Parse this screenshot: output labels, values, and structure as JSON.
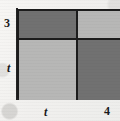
{
  "figure": {
    "type": "area-model-rectangle-partition",
    "background_color": "#f4f3f1",
    "line_color": "#1c1c1c"
  },
  "chart_data": {
    "type": "table",
    "title": "",
    "subtitle": "",
    "xlabel": "",
    "ylabel": "",
    "columns": [
      "t",
      "4"
    ],
    "rows": [
      "3",
      "t"
    ],
    "column_widths": [
      59,
      44
    ],
    "row_heights": [
      29,
      60
    ],
    "cells": [
      {
        "row": "3",
        "column": "t",
        "position": "top-left",
        "shade": "dark",
        "color": "#717171"
      },
      {
        "row": "3",
        "column": "4",
        "position": "top-right",
        "shade": "light",
        "color": "#b7b7b6"
      },
      {
        "row": "t",
        "column": "t",
        "position": "bottom-left",
        "shade": "light",
        "color": "#b7b7b6"
      },
      {
        "row": "t",
        "column": "4",
        "position": "bottom-right",
        "shade": "dark",
        "color": "#717171"
      }
    ],
    "legend": [],
    "grid": true
  },
  "labels": {
    "left_top": "3",
    "left_bottom": "t",
    "bottom_left": "t",
    "bottom_right": "4"
  },
  "colors": {
    "dark_fill": "#717171",
    "light_fill": "#b7b7b6",
    "stroke": "#1c1c1c",
    "paper": "#f4f3f1",
    "text": "#1a1a1a"
  }
}
